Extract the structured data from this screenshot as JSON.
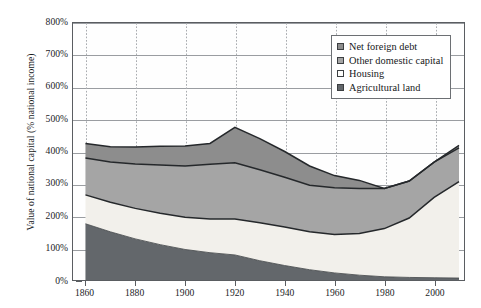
{
  "chart_data": {
    "type": "area",
    "stacked": true,
    "title": "",
    "subtitle": "",
    "xlabel": "",
    "ylabel": "Value of national capital (% national income)",
    "x": [
      1860,
      1870,
      1880,
      1890,
      1900,
      1910,
      1920,
      1930,
      1940,
      1950,
      1960,
      1970,
      1980,
      1990,
      2000,
      2010
    ],
    "xlim": [
      1855,
      2012
    ],
    "ylim": [
      0,
      800
    ],
    "ytick_labels": [
      "0%",
      "100%",
      "200%",
      "300%",
      "400%",
      "500%",
      "600%",
      "700%",
      "800%"
    ],
    "ytick_values": [
      0,
      100,
      200,
      300,
      400,
      500,
      600,
      700,
      800
    ],
    "xtick_labels": [
      "1860",
      "1880",
      "1900",
      "1920",
      "1940",
      "1960",
      "1980",
      "2000"
    ],
    "xtick_values": [
      1860,
      1880,
      1900,
      1920,
      1940,
      1960,
      1980,
      2000
    ],
    "grid": {
      "horizontal": "solid",
      "vertical": "dotted"
    },
    "legend_position": "top-right",
    "stack_order_bottom_to_top": [
      "Agricultural land",
      "Housing",
      "Other domestic capital",
      "Net foreign debt"
    ],
    "series": [
      {
        "name": "Agricultural land",
        "color": "#63676b",
        "values": [
          175,
          150,
          128,
          110,
          95,
          85,
          78,
          60,
          45,
          32,
          22,
          15,
          10,
          8,
          7,
          6
        ]
      },
      {
        "name": "Housing",
        "color": "#f2f0eb",
        "values": [
          90,
          92,
          95,
          98,
          100,
          105,
          112,
          118,
          120,
          118,
          120,
          130,
          150,
          185,
          250,
          300
        ]
      },
      {
        "name": "Other domestic capital",
        "color": "#a5a5a5",
        "values": [
          115,
          125,
          138,
          150,
          160,
          170,
          175,
          165,
          155,
          145,
          145,
          140,
          125,
          115,
          110,
          105
        ]
      },
      {
        "name": "Net foreign debt",
        "color": "#8d8d8d",
        "values": [
          45,
          48,
          53,
          58,
          62,
          65,
          110,
          97,
          80,
          60,
          38,
          25,
          0,
          0,
          0,
          8
        ]
      }
    ],
    "cumulative_top_of_agricultural_land": [
      175,
      150,
      128,
      110,
      95,
      85,
      78,
      60,
      45,
      32,
      22,
      15,
      10,
      8,
      7,
      6
    ],
    "cumulative_top_of_housing": [
      265,
      242,
      223,
      208,
      195,
      190,
      190,
      178,
      165,
      150,
      142,
      145,
      160,
      193,
      257,
      306
    ],
    "cumulative_top_of_other_domestic_capital": [
      380,
      367,
      361,
      358,
      355,
      360,
      435,
      410,
      358,
      350,
      320,
      300,
      285,
      295,
      360,
      412
    ],
    "cumulative_total": [
      425,
      415,
      414,
      416,
      417,
      425,
      545,
      507,
      438,
      410,
      358,
      325,
      285,
      295,
      360,
      420
    ]
  },
  "legend": {
    "items": [
      {
        "label": "Net foreign debt",
        "color": "#8d8d8d"
      },
      {
        "label": "Other domestic capital",
        "color": "#a5a5a5"
      },
      {
        "label": "Housing",
        "color": "#fdfdfb"
      },
      {
        "label": "Agricultural land",
        "color": "#63676b"
      }
    ]
  }
}
